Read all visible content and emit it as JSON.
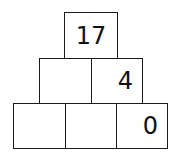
{
  "pyramid": {
    "rows": [
      {
        "cells": [
          "17"
        ]
      },
      {
        "cells": [
          "",
          "4"
        ]
      },
      {
        "cells": [
          "",
          "",
          "0"
        ]
      }
    ]
  }
}
